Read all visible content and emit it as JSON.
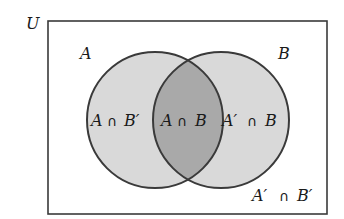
{
  "diagram": {
    "type": "venn",
    "universe_label": "U",
    "sets": [
      {
        "name": "A",
        "label": "A"
      },
      {
        "name": "B",
        "label": "B"
      }
    ],
    "regions": {
      "a_only": {
        "set_a": "A",
        "op": "∩",
        "set_b": "B′"
      },
      "both": {
        "set_a": "A",
        "op": "∩",
        "set_b": "B"
      },
      "b_only": {
        "set_a": "A′",
        "op": "∩",
        "set_b": "B"
      },
      "neither": {
        "set_a": "A′",
        "op": "∩",
        "set_b": "B′"
      }
    },
    "colors": {
      "single_fill": "#d9d9d9",
      "overlap_fill": "#a9a9a9",
      "stroke": "#3a3a3a",
      "background": "#ffffff"
    }
  }
}
